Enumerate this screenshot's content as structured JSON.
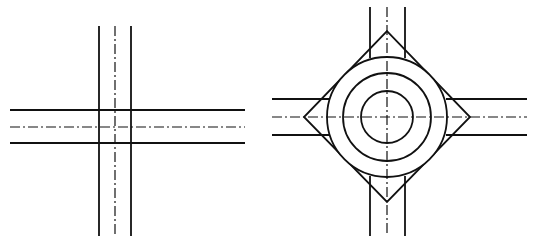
{
  "figures": [
    {
      "name": "plain-intersection",
      "type": "four-way crossroad",
      "vertical_road": {
        "edge_x": [
          99,
          131
        ],
        "center_x": 115,
        "y_range": [
          26,
          236
        ]
      },
      "horizontal_road": {
        "edge_y": [
          110,
          143
        ],
        "center_y": 127,
        "x_range": [
          10,
          245
        ]
      }
    },
    {
      "name": "roundabout-intersection",
      "type": "roundabout",
      "center": [
        387,
        117
      ],
      "circles_r": [
        60,
        44,
        26
      ],
      "diamond": {
        "top": [
          387,
          31
        ],
        "right": [
          470,
          117
        ],
        "bottom": [
          387,
          202
        ],
        "left": [
          304,
          117
        ]
      },
      "vertical_road": {
        "edge_x": [
          370,
          405
        ],
        "center_x": 387,
        "top_y_range": [
          7,
          58
        ],
        "bottom_y_range": [
          176,
          236
        ]
      },
      "horizontal_road": {
        "edge_y": [
          99,
          135
        ],
        "center_y": 117,
        "left_x_range": [
          272,
          329
        ],
        "right_x_range": [
          446,
          527
        ]
      }
    }
  ],
  "colors": {
    "line": "#111111",
    "background": "#ffffff"
  }
}
